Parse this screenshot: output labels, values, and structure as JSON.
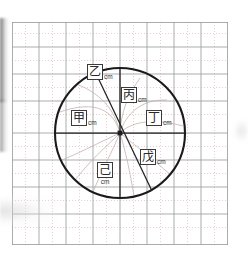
{
  "figure": {
    "kind": "geometry-diagram",
    "background_color": "#ffffff",
    "grid": {
      "major_line_color": "#9a9a9c",
      "minor_line_color": "#d9b9bb",
      "left": 12,
      "top": 22,
      "right": 228,
      "bottom": 245,
      "major_step": 27,
      "minor_dashed": true
    },
    "circle": {
      "center_x": 120,
      "center_y": 133,
      "radius": 65,
      "stroke_color": "#1a1a1c",
      "stroke_width": 2.1
    },
    "diameters": [
      {
        "name": "horizontal-diameter",
        "x1": 55,
        "y1": 133,
        "x2": 185,
        "y2": 133
      },
      {
        "name": "vertical-diameter",
        "x1": 120,
        "y1": 68,
        "x2": 120,
        "y2": 198
      },
      {
        "name": "oblique-diameter",
        "x1": 95,
        "y1": 73,
        "x2": 152,
        "y2": 191
      }
    ],
    "arc_color": "#bfa9aa"
  },
  "labels": [
    {
      "id": "label-yi",
      "glyph": "乙",
      "unit": "cm",
      "layout": "inline",
      "x": 87,
      "y": 64,
      "region": "upper-left-oblique"
    },
    {
      "id": "label-bing",
      "glyph": "丙",
      "unit": "cm",
      "layout": "inline",
      "x": 121,
      "y": 87,
      "region": "upper-right-inner"
    },
    {
      "id": "label-jia",
      "glyph": "甲",
      "unit": "cm",
      "layout": "inline",
      "x": 71,
      "y": 110,
      "region": "left-radius"
    },
    {
      "id": "label-ding",
      "glyph": "丁",
      "unit": "cm",
      "layout": "inline",
      "x": 146,
      "y": 110,
      "region": "right-radius"
    },
    {
      "id": "label-wu",
      "glyph": "戊",
      "unit": "cm",
      "layout": "inline",
      "x": 140,
      "y": 149,
      "region": "lower-right-oblique"
    },
    {
      "id": "label-ji",
      "glyph": "己",
      "unit": "cm",
      "layout": "stacked",
      "x": 97,
      "y": 160,
      "region": "lower-left-inner"
    }
  ]
}
